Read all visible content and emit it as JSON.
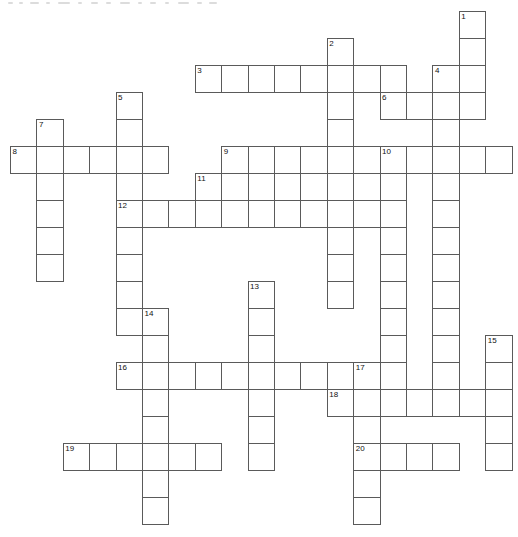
{
  "puzzle": {
    "title": "Crossword puzzle grid",
    "type": "crossword-grid",
    "grid": {
      "columns": 19,
      "rows": 19,
      "origin_x": 10,
      "origin_y": 11,
      "cell_width": 26.4,
      "cell_height": 27,
      "line_color": "#5a5a5a",
      "cell_fill": "#ffffff",
      "number_color": "#111111",
      "page_background": "#ffffff"
    },
    "entries": [
      {
        "number": 1,
        "direction": "down",
        "col": 17,
        "row": 0,
        "length": 4
      },
      {
        "number": 2,
        "direction": "down",
        "col": 12,
        "row": 1,
        "length": 9
      },
      {
        "number": 3,
        "direction": "across",
        "col": 7,
        "row": 2,
        "length": 8
      },
      {
        "number": 4,
        "direction": "down",
        "col": 16,
        "row": 2,
        "length": 10
      },
      {
        "number": 5,
        "direction": "down",
        "col": 4,
        "row": 3,
        "length": 8
      },
      {
        "number": 6,
        "direction": "across",
        "col": 14,
        "row": 3,
        "length": 4
      },
      {
        "number": 7,
        "direction": "down",
        "col": 1,
        "row": 4,
        "length": 5
      },
      {
        "number": 8,
        "direction": "across",
        "col": 0,
        "row": 5,
        "length": 6
      },
      {
        "number": 9,
        "direction": "across",
        "col": 8,
        "row": 5,
        "length": 11
      },
      {
        "number": 10,
        "direction": "down",
        "col": 14,
        "row": 5,
        "length": 11
      },
      {
        "number": 11,
        "direction": "across",
        "col": 7,
        "row": 6,
        "length": 5
      },
      {
        "number": 12,
        "direction": "across",
        "col": 4,
        "row": 7,
        "length": 11
      },
      {
        "number": 13,
        "direction": "down",
        "col": 9,
        "row": 10,
        "length": 7
      },
      {
        "number": 14,
        "direction": "down",
        "col": 5,
        "row": 11,
        "length": 8
      },
      {
        "number": 15,
        "direction": "down",
        "col": 18,
        "row": 12,
        "length": 5
      },
      {
        "number": 16,
        "direction": "across",
        "col": 4,
        "row": 13,
        "length": 9
      },
      {
        "number": 17,
        "direction": "down",
        "col": 13,
        "row": 13,
        "length": 7
      },
      {
        "number": 18,
        "direction": "across",
        "col": 12,
        "row": 14,
        "length": 7
      },
      {
        "number": 19,
        "direction": "across",
        "col": 2,
        "row": 16,
        "length": 6
      },
      {
        "number": 20,
        "direction": "across",
        "col": 13,
        "row": 16,
        "length": 4
      }
    ],
    "cells": [
      {
        "col": 17,
        "row": 0,
        "number": "1"
      },
      {
        "col": 17,
        "row": 1
      },
      {
        "col": 12,
        "row": 1,
        "number": "2"
      },
      {
        "col": 7,
        "row": 2,
        "number": "3"
      },
      {
        "col": 8,
        "row": 2
      },
      {
        "col": 9,
        "row": 2
      },
      {
        "col": 10,
        "row": 2
      },
      {
        "col": 11,
        "row": 2
      },
      {
        "col": 12,
        "row": 2
      },
      {
        "col": 13,
        "row": 2
      },
      {
        "col": 14,
        "row": 2
      },
      {
        "col": 16,
        "row": 2,
        "number": "4"
      },
      {
        "col": 17,
        "row": 2
      },
      {
        "col": 4,
        "row": 3,
        "number": "5"
      },
      {
        "col": 12,
        "row": 3
      },
      {
        "col": 14,
        "row": 3,
        "number": "6"
      },
      {
        "col": 15,
        "row": 3
      },
      {
        "col": 16,
        "row": 3
      },
      {
        "col": 17,
        "row": 3
      },
      {
        "col": 1,
        "row": 4,
        "number": "7"
      },
      {
        "col": 4,
        "row": 4
      },
      {
        "col": 12,
        "row": 4
      },
      {
        "col": 16,
        "row": 4
      },
      {
        "col": 0,
        "row": 5,
        "number": "8"
      },
      {
        "col": 1,
        "row": 5
      },
      {
        "col": 2,
        "row": 5
      },
      {
        "col": 3,
        "row": 5
      },
      {
        "col": 4,
        "row": 5
      },
      {
        "col": 5,
        "row": 5
      },
      {
        "col": 8,
        "row": 5,
        "number": "9"
      },
      {
        "col": 9,
        "row": 5
      },
      {
        "col": 10,
        "row": 5
      },
      {
        "col": 11,
        "row": 5
      },
      {
        "col": 12,
        "row": 5
      },
      {
        "col": 13,
        "row": 5
      },
      {
        "col": 14,
        "row": 5,
        "number": "10"
      },
      {
        "col": 15,
        "row": 5
      },
      {
        "col": 16,
        "row": 5
      },
      {
        "col": 17,
        "row": 5
      },
      {
        "col": 18,
        "row": 5
      },
      {
        "col": 1,
        "row": 6
      },
      {
        "col": 4,
        "row": 6
      },
      {
        "col": 7,
        "row": 6,
        "number": "11"
      },
      {
        "col": 8,
        "row": 6
      },
      {
        "col": 9,
        "row": 6
      },
      {
        "col": 10,
        "row": 6
      },
      {
        "col": 11,
        "row": 6
      },
      {
        "col": 12,
        "row": 6
      },
      {
        "col": 14,
        "row": 6
      },
      {
        "col": 16,
        "row": 6
      },
      {
        "col": 1,
        "row": 7
      },
      {
        "col": 4,
        "row": 7,
        "number": "12"
      },
      {
        "col": 5,
        "row": 7
      },
      {
        "col": 6,
        "row": 7
      },
      {
        "col": 7,
        "row": 7
      },
      {
        "col": 8,
        "row": 7
      },
      {
        "col": 9,
        "row": 7
      },
      {
        "col": 10,
        "row": 7
      },
      {
        "col": 11,
        "row": 7
      },
      {
        "col": 12,
        "row": 7
      },
      {
        "col": 13,
        "row": 7
      },
      {
        "col": 14,
        "row": 7
      },
      {
        "col": 16,
        "row": 7
      },
      {
        "col": 1,
        "row": 8
      },
      {
        "col": 4,
        "row": 8
      },
      {
        "col": 12,
        "row": 8
      },
      {
        "col": 14,
        "row": 8
      },
      {
        "col": 16,
        "row": 8
      },
      {
        "col": 1,
        "row": 9
      },
      {
        "col": 4,
        "row": 9
      },
      {
        "col": 12,
        "row": 9
      },
      {
        "col": 14,
        "row": 9
      },
      {
        "col": 16,
        "row": 9
      },
      {
        "col": 4,
        "row": 10
      },
      {
        "col": 9,
        "row": 10,
        "number": "13"
      },
      {
        "col": 12,
        "row": 10
      },
      {
        "col": 14,
        "row": 10
      },
      {
        "col": 16,
        "row": 10
      },
      {
        "col": 4,
        "row": 11
      },
      {
        "col": 5,
        "row": 11,
        "number": "14"
      },
      {
        "col": 9,
        "row": 11
      },
      {
        "col": 14,
        "row": 11
      },
      {
        "col": 16,
        "row": 11
      },
      {
        "col": 5,
        "row": 12
      },
      {
        "col": 9,
        "row": 12
      },
      {
        "col": 14,
        "row": 12
      },
      {
        "col": 16,
        "row": 12
      },
      {
        "col": 18,
        "row": 12,
        "number": "15"
      },
      {
        "col": 4,
        "row": 13,
        "number": "16"
      },
      {
        "col": 5,
        "row": 13
      },
      {
        "col": 6,
        "row": 13
      },
      {
        "col": 7,
        "row": 13
      },
      {
        "col": 8,
        "row": 13
      },
      {
        "col": 9,
        "row": 13
      },
      {
        "col": 10,
        "row": 13
      },
      {
        "col": 11,
        "row": 13
      },
      {
        "col": 12,
        "row": 13
      },
      {
        "col": 13,
        "row": 13,
        "number": "17"
      },
      {
        "col": 14,
        "row": 13
      },
      {
        "col": 16,
        "row": 13
      },
      {
        "col": 18,
        "row": 13
      },
      {
        "col": 5,
        "row": 14
      },
      {
        "col": 9,
        "row": 14
      },
      {
        "col": 12,
        "row": 14,
        "number": "18"
      },
      {
        "col": 13,
        "row": 14
      },
      {
        "col": 14,
        "row": 14
      },
      {
        "col": 15,
        "row": 14
      },
      {
        "col": 16,
        "row": 14
      },
      {
        "col": 17,
        "row": 14
      },
      {
        "col": 18,
        "row": 14
      },
      {
        "col": 5,
        "row": 15
      },
      {
        "col": 9,
        "row": 15
      },
      {
        "col": 13,
        "row": 15
      },
      {
        "col": 18,
        "row": 15
      },
      {
        "col": 2,
        "row": 16,
        "number": "19"
      },
      {
        "col": 3,
        "row": 16
      },
      {
        "col": 4,
        "row": 16
      },
      {
        "col": 5,
        "row": 16
      },
      {
        "col": 6,
        "row": 16
      },
      {
        "col": 7,
        "row": 16
      },
      {
        "col": 9,
        "row": 16
      },
      {
        "col": 13,
        "row": 16,
        "number": "20"
      },
      {
        "col": 14,
        "row": 16
      },
      {
        "col": 15,
        "row": 16
      },
      {
        "col": 16,
        "row": 16
      },
      {
        "col": 18,
        "row": 16
      },
      {
        "col": 5,
        "row": 17
      },
      {
        "col": 13,
        "row": 17
      },
      {
        "col": 5,
        "row": 18
      },
      {
        "col": 13,
        "row": 18
      }
    ],
    "top_marks": [
      {
        "left": 0,
        "width": 5
      },
      {
        "left": 11,
        "width": 4
      },
      {
        "left": 22,
        "width": 9
      },
      {
        "left": 38,
        "width": 4
      },
      {
        "left": 50,
        "width": 12
      },
      {
        "left": 70,
        "width": 4
      },
      {
        "left": 83,
        "width": 7
      },
      {
        "left": 98,
        "width": 5
      },
      {
        "left": 112,
        "width": 10
      },
      {
        "left": 130,
        "width": 4
      },
      {
        "left": 142,
        "width": 6
      },
      {
        "left": 157,
        "width": 4
      },
      {
        "left": 170,
        "width": 11
      },
      {
        "left": 189,
        "width": 5
      },
      {
        "left": 201,
        "width": 8
      }
    ]
  }
}
